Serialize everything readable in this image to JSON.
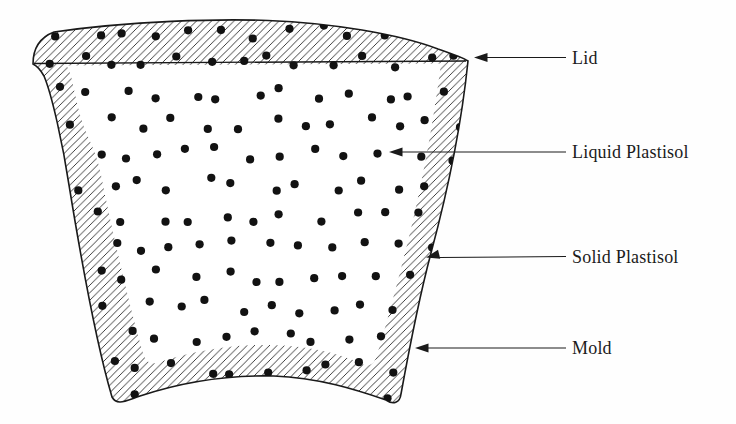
{
  "figure": {
    "labels": {
      "lid": "Lid",
      "liquid": "Liquid Plastisol",
      "solid": "Solid Plastisol",
      "mold": "Mold"
    },
    "colors": {
      "ink": "#1a1a1a",
      "dot": "#121212",
      "background": "#fefefe"
    }
  }
}
